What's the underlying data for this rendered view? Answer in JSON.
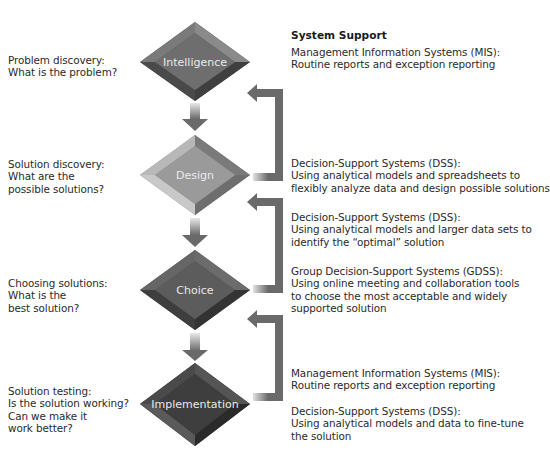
{
  "header": {
    "title": "System Support"
  },
  "stages": [
    {
      "name": "Intelligence",
      "question": [
        "Problem discovery:",
        "What is the problem?"
      ],
      "color": "#6e6e6e"
    },
    {
      "name": "Design",
      "question": [
        "Solution discovery:",
        "What are the",
        "possible solutions?"
      ],
      "color": "#9a9a9a"
    },
    {
      "name": "Choice",
      "question": [
        "Choosing solutions:",
        "What is the",
        "best solution?"
      ],
      "color": "#5c5c5c"
    },
    {
      "name": "Implementation",
      "question": [
        "Solution testing:",
        "Is the solution working?",
        "Can we make it",
        "work better?"
      ],
      "color": "#3e3e3e"
    }
  ],
  "support": [
    {
      "lines": [
        "Management Information Systems (MIS):",
        "Routine reports and exception reporting"
      ]
    },
    {
      "lines": [
        "Decision-Support Systems (DSS):",
        "Using analytical models and spreadsheets to",
        "flexibly analyze data and design possible solutions"
      ]
    },
    {
      "lines": [
        "Decision-Support Systems (DSS):",
        "Using analytical models and larger data sets to",
        "identify the “optimal” solution"
      ]
    },
    {
      "lines": [
        "Group Decision-Support Systems (GDSS):",
        "Using online meeting and collaboration tools",
        "to choose the most acceptable and widely",
        "supported solution"
      ]
    },
    {
      "lines": [
        "Management Information Systems (MIS):",
        "Routine reports and exception reporting"
      ]
    },
    {
      "lines": [
        "Decision-Support Systems (DSS):",
        "Using analytical models and data to fine-tune",
        "the solution"
      ]
    }
  ],
  "colors": {
    "arrow": "#6a6a6a",
    "text": "#2a2a2a"
  }
}
